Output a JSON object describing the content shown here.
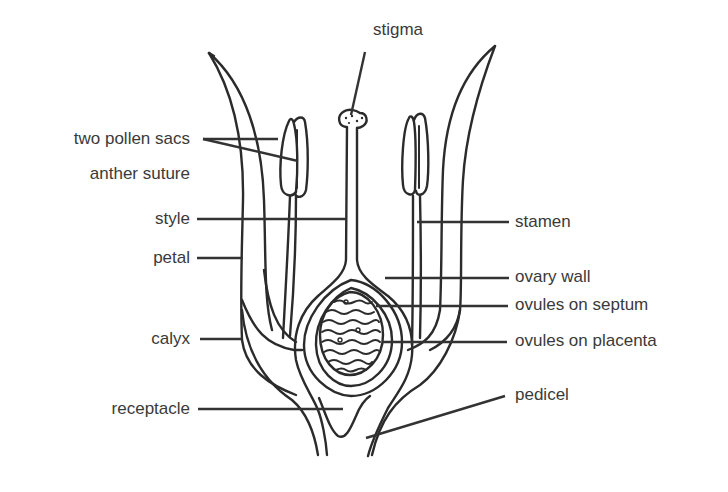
{
  "diagram": {
    "labels": {
      "stigma": "stigma",
      "two_pollen_sacs": "two pollen sacs",
      "anther_suture": "anther suture",
      "style": "style",
      "petal": "petal",
      "calyx": "calyx",
      "receptacle": "receptacle",
      "stamen": "stamen",
      "ovary_wall": "ovary wall",
      "ovules_on_septum": "ovules on septum",
      "ovules_on_placenta": "ovules on placenta",
      "pedicel": "pedicel"
    },
    "colors": {
      "line": "#2b2b2b",
      "text": "#3a3a3a",
      "background": "#ffffff"
    }
  }
}
